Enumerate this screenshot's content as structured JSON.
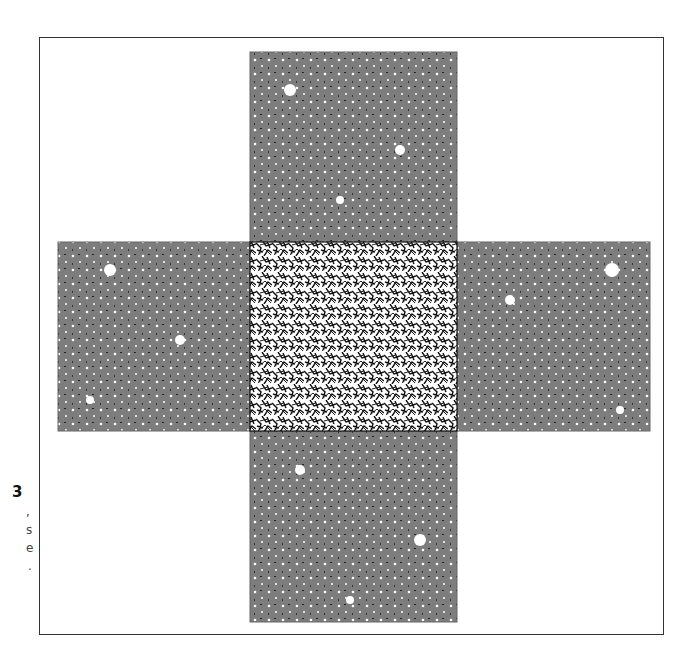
{
  "figure": {
    "caption_fragments": {
      "number": "3",
      "lines": [
        ",",
        "s",
        "e",
        "."
      ]
    },
    "colors": {
      "frame": "#333333",
      "central_cell": "#111111",
      "image_cells": "#7a7a7a",
      "background": "#ffffff"
    },
    "cells": [
      {
        "name": "top-image",
        "x": 250,
        "y": 52,
        "w": 207,
        "h": 190
      },
      {
        "name": "left-image",
        "x": 58,
        "y": 242,
        "w": 192,
        "h": 189
      },
      {
        "name": "central-cell",
        "x": 250,
        "y": 242,
        "w": 207,
        "h": 189
      },
      {
        "name": "right-image",
        "x": 457,
        "y": 242,
        "w": 193,
        "h": 189
      },
      {
        "name": "bottom-image",
        "x": 250,
        "y": 431,
        "w": 207,
        "h": 191
      }
    ]
  }
}
